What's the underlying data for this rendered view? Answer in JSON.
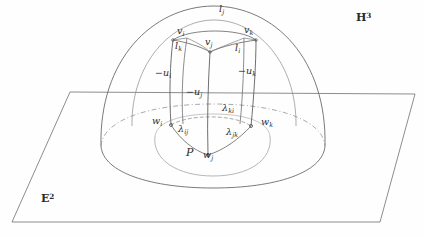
{
  "figure": {
    "caption_alt": "Hyperbolic dome over Euclidean plane with inscribed prism",
    "ink_color": "#4a4a4a",
    "faint_color": "#9a9a9a",
    "label_color": "#2b2b2b"
  },
  "spaces": {
    "hyperbolic": {
      "symbol": "H",
      "exponent": "3"
    },
    "euclidean": {
      "symbol": "E",
      "exponent": "2"
    }
  },
  "top_vertices": [
    {
      "id": "v_i",
      "base": "v",
      "sub": "i",
      "x": 177,
      "y": 32
    },
    {
      "id": "v_j",
      "base": "v",
      "sub": "j",
      "x": 213,
      "y": 43
    },
    {
      "id": "v_k",
      "base": "v",
      "sub": "k",
      "x": 250,
      "y": 31
    }
  ],
  "top_edges": [
    {
      "id": "l_j",
      "base": "l",
      "sub": "j",
      "x": 222,
      "y": 7
    },
    {
      "id": "l_k",
      "base": "l",
      "sub": "k",
      "x": 181,
      "y": 46
    },
    {
      "id": "l_i",
      "base": "l",
      "sub": "i",
      "x": 240,
      "y": 48
    }
  ],
  "wall_labels": [
    {
      "id": "-u_i",
      "base": "−u",
      "sub": "i",
      "x": 161,
      "y": 74
    },
    {
      "id": "-u_j",
      "base": "−u",
      "sub": "j",
      "x": 192,
      "y": 93
    },
    {
      "id": "-u_k",
      "base": "−u",
      "sub": "k",
      "x": 243,
      "y": 72
    }
  ],
  "base_vertices": [
    {
      "id": "w_i",
      "base": "w",
      "sub": "i",
      "x": 157,
      "y": 120
    },
    {
      "id": "w_j",
      "base": "w",
      "sub": "j",
      "x": 208,
      "y": 152
    },
    {
      "id": "w_k",
      "base": "w",
      "sub": "k",
      "x": 265,
      "y": 121
    }
  ],
  "lambda_labels": [
    {
      "id": "lambda_ki",
      "base": "λ",
      "sub": "ki",
      "x": 212,
      "y": 107
    },
    {
      "id": "lambda_ij",
      "base": "λ",
      "sub": "ij",
      "x": 183,
      "y": 127
    },
    {
      "id": "lambda_jk",
      "base": "λ",
      "sub": "jk",
      "x": 230,
      "y": 130
    }
  ],
  "polygon_label": {
    "id": "P",
    "base": "P",
    "x": 188,
    "y": 150
  }
}
